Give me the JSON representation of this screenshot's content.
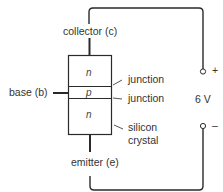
{
  "diagram": {
    "type": "npn-transistor-schematic",
    "labels": {
      "collector": "collector (c)",
      "base": "base (b)",
      "emitter": "emitter (e)",
      "junction_upper": "junction",
      "junction_lower": "junction",
      "silicon_line1": "silicon",
      "silicon_line2": "crystal",
      "voltage": "6 V",
      "plus": "+",
      "minus": "–"
    },
    "layers": [
      {
        "name": "top",
        "symbol": "n"
      },
      {
        "name": "middle",
        "symbol": "p"
      },
      {
        "name": "bottom",
        "symbol": "n"
      }
    ],
    "colors": {
      "line": "#2a2a2a",
      "background": "#ffffff"
    }
  }
}
